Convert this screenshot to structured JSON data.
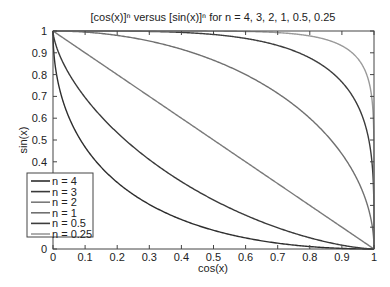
{
  "chart_data": {
    "type": "line",
    "title": "[cos(x)]ⁿ versus [sin(x)]ⁿ for n = 4, 3, 2, 1, 0.5, 0.25",
    "xlabel": "cos(x)",
    "ylabel": "sin(x)",
    "xlim": [
      0,
      1
    ],
    "ylim": [
      0,
      1
    ],
    "grid": false,
    "legend_position": "lower left",
    "x_ticks": [
      "0",
      "0.1",
      "0.2",
      "0.3",
      "0.4",
      "0.5",
      "0.6",
      "0.7",
      "0.8",
      "0.9",
      "1"
    ],
    "y_ticks": [
      "0",
      "0.1",
      "0.2",
      "0.3",
      "0.4",
      "0.5",
      "0.6",
      "0.7",
      "0.8",
      "0.9",
      "1"
    ],
    "y_ticks_visible_labels": [
      "0",
      "0.4",
      "0.5",
      "0.6",
      "0.7",
      "0.8",
      "0.9",
      "1"
    ],
    "x": [
      0,
      0.1,
      0.2,
      0.3,
      0.4,
      0.5,
      0.6,
      0.7,
      0.8,
      0.9,
      1
    ],
    "series": [
      {
        "name": "n = 4",
        "n": 4,
        "color": "#2e2e2e",
        "values": [
          1,
          0.468,
          0.306,
          0.205,
          0.135,
          0.086,
          0.051,
          0.027,
          0.011,
          0.003,
          0
        ]
      },
      {
        "name": "n = 3",
        "n": 3,
        "color": "#3a3a3a",
        "values": [
          1,
          0.695,
          0.534,
          0.41,
          0.309,
          0.225,
          0.155,
          0.097,
          0.051,
          0.018,
          0
        ]
      },
      {
        "name": "n = 2",
        "n": 2,
        "color": "#7a7a7a",
        "values": [
          1,
          0.9,
          0.8,
          0.7,
          0.6,
          0.5,
          0.4,
          0.3,
          0.2,
          0.1,
          0
        ]
      },
      {
        "name": "n = 1",
        "n": 1,
        "color": "#707070",
        "values": [
          1,
          0.995,
          0.98,
          0.954,
          0.917,
          0.866,
          0.8,
          0.714,
          0.6,
          0.436,
          0
        ]
      },
      {
        "name": "n = 0.5",
        "n": 0.5,
        "color": "#3c3c3c",
        "values": [
          1,
          1.0,
          1.0,
          0.998,
          0.994,
          0.984,
          0.966,
          0.932,
          0.863,
          0.729,
          0
        ]
      },
      {
        "name": "n = 0.25",
        "n": 0.25,
        "color": "#9a9a9a",
        "values": [
          1,
          1.0,
          1.0,
          1.0,
          1.0,
          1.0,
          0.998,
          0.993,
          0.977,
          0.916,
          0
        ]
      }
    ]
  }
}
